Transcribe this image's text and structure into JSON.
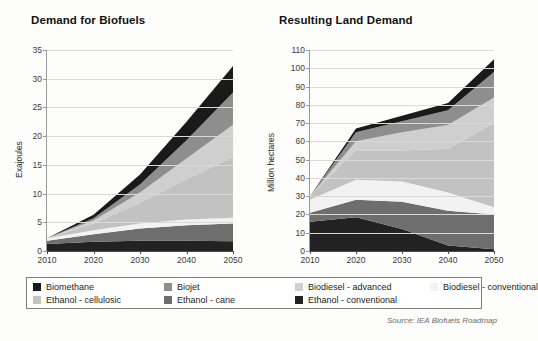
{
  "source_note": "Source: IEA Biofuels Roadmap",
  "legend": {
    "items": [
      {
        "label": "Biomethane",
        "color": "#1a1a1a"
      },
      {
        "label": "Biojet",
        "color": "#8e8e8e"
      },
      {
        "label": "Biodiesel - advanced",
        "color": "#cfcfcf"
      },
      {
        "label": "Biodiesel - conventional",
        "color": "#f2f2f2"
      },
      {
        "label": "Ethanol - cellulosic",
        "color": "#c2c2c2"
      },
      {
        "label": "Ethanol - cane",
        "color": "#6e6e6e"
      },
      {
        "label": "Ethanol - conventional",
        "color": "#222222"
      }
    ]
  },
  "chart_data": [
    {
      "type": "area",
      "title": "Demand for Biofuels",
      "xlabel": "",
      "ylabel": "Exajoules",
      "x": [
        2010,
        2020,
        2030,
        2040,
        2050
      ],
      "xlim": [
        2010,
        2050
      ],
      "ylim": [
        0,
        35
      ],
      "yticks": [
        0,
        5,
        10,
        15,
        20,
        25,
        30,
        35
      ],
      "xticks": [
        2010,
        2020,
        2030,
        2040,
        2050
      ],
      "grid": true,
      "stacked": true,
      "legend_position": "bottom",
      "series": [
        {
          "name": "Ethanol - conventional",
          "color": "#222222",
          "values": [
            1.2,
            1.6,
            1.8,
            1.8,
            1.7
          ]
        },
        {
          "name": "Ethanol - cane",
          "color": "#6e6e6e",
          "values": [
            0.6,
            1.3,
            2.1,
            2.7,
            3.1
          ]
        },
        {
          "name": "Biodiesel - conventional",
          "color": "#f2f2f2",
          "values": [
            0.4,
            0.7,
            0.9,
            1.0,
            1.0
          ]
        },
        {
          "name": "Ethanol - cellulosic",
          "color": "#c2c2c2",
          "values": [
            0.0,
            1.2,
            3.6,
            7.0,
            10.6
          ]
        },
        {
          "name": "Biodiesel - advanced",
          "color": "#cfcfcf",
          "values": [
            0.0,
            0.5,
            1.8,
            3.6,
            5.6
          ]
        },
        {
          "name": "Biojet",
          "color": "#8e8e8e",
          "values": [
            0.0,
            0.4,
            1.4,
            3.2,
            5.6
          ]
        },
        {
          "name": "Biomethane",
          "color": "#1a1a1a",
          "values": [
            0.0,
            0.6,
            1.7,
            3.2,
            4.6
          ]
        }
      ],
      "totals": [
        2.2,
        6.3,
        13.3,
        22.5,
        32.2
      ]
    },
    {
      "type": "area",
      "title": "Resulting Land Demand",
      "xlabel": "",
      "ylabel": "Million hectares",
      "x": [
        2010,
        2020,
        2030,
        2040,
        2050
      ],
      "xlim": [
        2010,
        2050
      ],
      "ylim": [
        0,
        110
      ],
      "yticks": [
        0,
        10,
        20,
        30,
        40,
        50,
        60,
        70,
        80,
        90,
        100,
        110
      ],
      "xticks": [
        2010,
        2020,
        2030,
        2040,
        2050
      ],
      "grid": true,
      "stacked": true,
      "legend_position": "bottom",
      "series": [
        {
          "name": "Ethanol - conventional",
          "color": "#222222",
          "values": [
            16,
            18.5,
            12,
            3,
            1
          ]
        },
        {
          "name": "Ethanol - cane",
          "color": "#6e6e6e",
          "values": [
            5,
            9.5,
            15,
            19,
            19
          ]
        },
        {
          "name": "Biodiesel - conventional",
          "color": "#f2f2f2",
          "values": [
            7,
            11,
            11,
            10,
            4
          ]
        },
        {
          "name": "Ethanol - cellulosic",
          "color": "#c2c2c2",
          "values": [
            2,
            16,
            17,
            24,
            46
          ]
        },
        {
          "name": "Biodiesel - advanced",
          "color": "#cfcfcf",
          "values": [
            0,
            5,
            10,
            13,
            14
          ]
        },
        {
          "name": "Biojet",
          "color": "#8e8e8e",
          "values": [
            0,
            5,
            6,
            8,
            14
          ]
        },
        {
          "name": "Biomethane",
          "color": "#1a1a1a",
          "values": [
            0,
            2,
            3,
            4,
            7
          ]
        }
      ],
      "totals": [
        30,
        67,
        74,
        81,
        105
      ]
    }
  ]
}
